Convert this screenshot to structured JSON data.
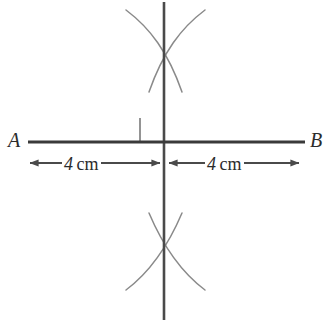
{
  "figure": {
    "type": "geometric-construction",
    "background_color": "#ffffff",
    "line_color": "#3a3a3a",
    "arc_color": "#8a8a8a",
    "text_color": "#2b2b2b"
  },
  "labels": {
    "point_a": "A",
    "point_b": "B"
  },
  "dimensions": {
    "left": {
      "value": "4",
      "unit": "cm"
    },
    "right": {
      "value": "4",
      "unit": "cm"
    }
  },
  "geometry": {
    "segment_ab": {
      "x1": 28,
      "y1": 142,
      "x2": 305,
      "y2": 142
    },
    "bisector": {
      "x": 164,
      "y1": 2,
      "y2": 320
    },
    "midpoint": {
      "x": 164,
      "y": 142
    },
    "right_angle_marker": {
      "x": 140,
      "y": 118,
      "size": 24,
      "corner": "upper-left"
    },
    "arc_cross_top": {
      "x": 164,
      "y": 42
    },
    "arc_cross_bottom": {
      "x": 164,
      "y": 255
    },
    "dim_line_y": 163,
    "left_dim_span": {
      "from": 28,
      "to": 162
    },
    "right_dim_span": {
      "from": 167,
      "to": 300
    }
  }
}
